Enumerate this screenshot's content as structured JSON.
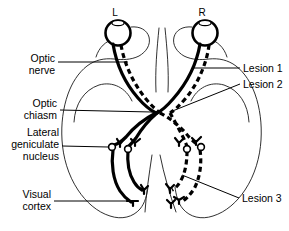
{
  "figure": {
    "width": 289,
    "height": 231,
    "background": "#ffffff",
    "ink_color": "#000000"
  },
  "eye_labels": [
    {
      "id": "left-eye",
      "text": "L"
    },
    {
      "id": "right-eye",
      "text": "R"
    }
  ],
  "left_labels": [
    {
      "id": "optic-nerve",
      "line1": "Optic",
      "line2": "nerve",
      "line3": ""
    },
    {
      "id": "optic-chiasm",
      "line1": "Optic",
      "line2": "chiasm",
      "line3": ""
    },
    {
      "id": "lateral-geniculate-nucleus",
      "line1": "Lateral",
      "line2": "geniculate",
      "line3": "nucleus"
    },
    {
      "id": "visual-cortex",
      "line1": "Visual",
      "line2": "cortex",
      "line3": ""
    }
  ],
  "right_labels": [
    {
      "id": "lesion-1",
      "text": "Lesion 1"
    },
    {
      "id": "lesion-2",
      "text": "Lesion 2"
    },
    {
      "id": "lesion-3",
      "text": "Lesion 3"
    }
  ],
  "legend_notes": {
    "solid_tract": "solid line pathway",
    "dashed_tract": "dashed line pathway"
  }
}
